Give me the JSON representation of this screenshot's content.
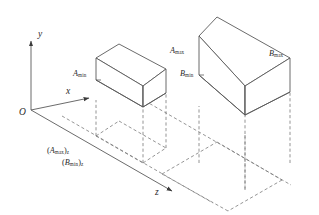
{
  "figure": {
    "type": "3d-bounding-box-diagram",
    "background_color": "#ffffff",
    "line_color": "#5a5a5a",
    "dashed_color": "#7a7a7a",
    "text_color": "#2b2b2b"
  },
  "axes": {
    "origin_label": "O",
    "x_label": "x",
    "y_label": "y",
    "z_label": "z"
  },
  "boxes": [
    {
      "id": "A",
      "max_label_letter": "A",
      "max_label_sub": "max",
      "min_label_letter": "A",
      "min_label_sub": "min"
    },
    {
      "id": "B",
      "max_label_letter": "B",
      "max_label_sub": "max",
      "min_label_letter": "B",
      "min_label_sub": "min"
    }
  ],
  "ground_labels": [
    {
      "open": "(",
      "letter": "A",
      "sub": "max",
      "close": ")",
      "axis_sub": "z"
    },
    {
      "open": "(",
      "letter": "B",
      "sub": "min",
      "close": ")",
      "axis_sub": "z"
    }
  ]
}
